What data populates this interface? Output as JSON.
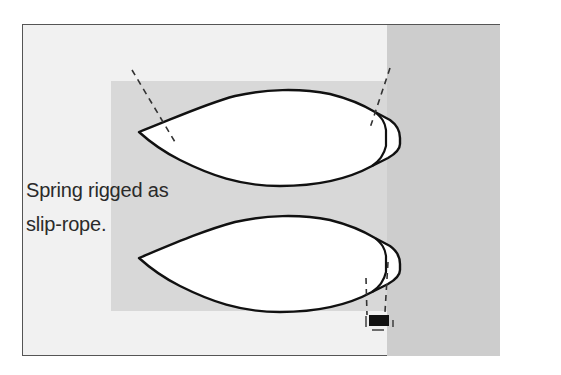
{
  "figure": {
    "caption_label": {
      "line1": "Spring rigged as",
      "line2": "slip-rope."
    },
    "colors": {
      "frame_border": "#555555",
      "background_light": "#f1f1f1",
      "background_mid": "#d8d8d8",
      "background_right": "#cdcdcd",
      "hull_fill": "#ffffff",
      "hull_stroke": "#111111",
      "line_dash": "#333333",
      "bollard": "#111111"
    },
    "elements": {
      "boat_top": "boat-hull-top",
      "boat_bottom": "boat-hull-bottom",
      "bollard": "bollard-icon"
    }
  }
}
